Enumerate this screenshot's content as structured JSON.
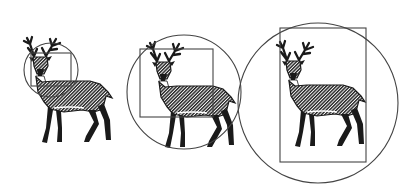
{
  "diagram": {
    "description": "Three deer figures with progressively larger bounding circle and rectangle",
    "colors": {
      "background": "#ffffff",
      "ink": "#1a1a1a",
      "frame": "#444444",
      "hatch": "#555555"
    },
    "panels": [
      {
        "id": "small",
        "circle": {
          "cx": 51,
          "cy": 70,
          "r": 27
        },
        "rect": {
          "x": 31,
          "y": 53,
          "w": 40,
          "h": 33
        },
        "deer": {
          "x": 20,
          "y": 36,
          "scale": 1.0
        }
      },
      {
        "id": "medium",
        "circle": {
          "cx": 184,
          "cy": 92,
          "r": 57
        },
        "rect": {
          "x": 140,
          "y": 49,
          "w": 73,
          "h": 68
        },
        "deer": {
          "x": 143,
          "y": 41,
          "scale": 1.0
        }
      },
      {
        "id": "large",
        "circle": {
          "cx": 318,
          "cy": 103,
          "r": 80
        },
        "rect": {
          "x": 280,
          "y": 28,
          "w": 86,
          "h": 134
        },
        "deer": {
          "x": 273,
          "y": 40,
          "scale": 1.0
        }
      }
    ]
  }
}
